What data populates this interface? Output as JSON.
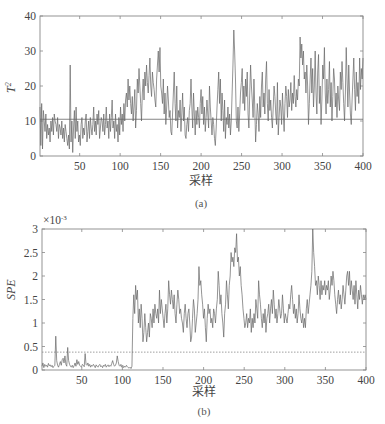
{
  "chart_data": [
    {
      "id": "a",
      "type": "line",
      "caption": "(a)",
      "xlabel": "采样",
      "ylabel": "T²",
      "ylabel_main": "T",
      "ylabel_sup": "2",
      "xlim": [
        1,
        400
      ],
      "ylim": [
        0,
        40
      ],
      "xticks": [
        50,
        100,
        150,
        200,
        250,
        300,
        350,
        400
      ],
      "yticks": [
        0,
        10,
        20,
        30,
        40
      ],
      "threshold": 10.5,
      "series": [
        {
          "name": "T2 statistic",
          "values": [
            14,
            3,
            15,
            2,
            13,
            10,
            7,
            12,
            5,
            9,
            6,
            8,
            4,
            10,
            7,
            11,
            6,
            12,
            10,
            9,
            7,
            11,
            5,
            9,
            8,
            6,
            10,
            5,
            8,
            4,
            9,
            7,
            5,
            3,
            6,
            2,
            26,
            4,
            10,
            1,
            8,
            13,
            5,
            14,
            7,
            10,
            4,
            6,
            3,
            9,
            11,
            5,
            8,
            6,
            10,
            12,
            4,
            7,
            10,
            5,
            11,
            8,
            6,
            9,
            14,
            7,
            10,
            6,
            12,
            9,
            13,
            5,
            8,
            11,
            10,
            7,
            12,
            6,
            9,
            14,
            8,
            10,
            5,
            12,
            7,
            11,
            16,
            8,
            10,
            5,
            12,
            7,
            9,
            4,
            11,
            6,
            14,
            9,
            12,
            7,
            15,
            10,
            16,
            18,
            14,
            22,
            16,
            20,
            15,
            12,
            17,
            10,
            14,
            19,
            8,
            13,
            22,
            18,
            25,
            20,
            15,
            10,
            18,
            22,
            16,
            24,
            20,
            26,
            21,
            18,
            23,
            28,
            20,
            17,
            24,
            21,
            19,
            16,
            14,
            22,
            26,
            30,
            24,
            31,
            20,
            18,
            15,
            22,
            12,
            18,
            9,
            14,
            20,
            16,
            11,
            13,
            7,
            6,
            12,
            18,
            24,
            15,
            10,
            20,
            8,
            13,
            11,
            16,
            7,
            12,
            18,
            10,
            14,
            6,
            5,
            9,
            11,
            7,
            13,
            15,
            22,
            14,
            8,
            18,
            12,
            6,
            13,
            9,
            14,
            11,
            8,
            15,
            19,
            12,
            17,
            9,
            14,
            7,
            11,
            16,
            12,
            8,
            20,
            14,
            10,
            6,
            11,
            9,
            5,
            3,
            8,
            14,
            19,
            24,
            15,
            22,
            10,
            18,
            13,
            7,
            16,
            5,
            11,
            9,
            14,
            8,
            12,
            6,
            10,
            18,
            26,
            36,
            30,
            22,
            10,
            8,
            14,
            7,
            12,
            18,
            21,
            25,
            15,
            20,
            13,
            22,
            17,
            24,
            12,
            8,
            18,
            26,
            20,
            16,
            11,
            22,
            14,
            4,
            9,
            15,
            12,
            7,
            17,
            11,
            20,
            24,
            14,
            18,
            12,
            22,
            27,
            15,
            10,
            19,
            13,
            16,
            11,
            8,
            14,
            20,
            17,
            12,
            9,
            21,
            6,
            11,
            16,
            14,
            9,
            18,
            12,
            7,
            15,
            20,
            17,
            11,
            19,
            14,
            16,
            21,
            13,
            18,
            15,
            23,
            17,
            14,
            19,
            16,
            22,
            20,
            34,
            28,
            32,
            26,
            30,
            22,
            24,
            18,
            26,
            20,
            9,
            15,
            22,
            28,
            18,
            25,
            14,
            20,
            30,
            18,
            12,
            24,
            29,
            15,
            20,
            9,
            16,
            26,
            22,
            31,
            18,
            12,
            22,
            15,
            19,
            27,
            14,
            21,
            10,
            17,
            25,
            22,
            14,
            18,
            11,
            20,
            16,
            13,
            24,
            19,
            27,
            21,
            15,
            10,
            18,
            31,
            22,
            14,
            26,
            18,
            12,
            9,
            16,
            22,
            28,
            19,
            13,
            24,
            17,
            21,
            15,
            28,
            19,
            25,
            22,
            28
          ]
        }
      ],
      "colors": {
        "line": "#666666",
        "threshold": "#666666",
        "axes": "#888888"
      }
    },
    {
      "id": "b",
      "type": "line",
      "caption": "(b)",
      "xlabel": "采样",
      "ylabel": "SPE",
      "scale_label": "×10⁻³",
      "scale_base": "×10",
      "scale_exp": "-3",
      "xlim": [
        1,
        400
      ],
      "ylim": [
        0,
        3
      ],
      "xticks": [
        50,
        100,
        150,
        200,
        250,
        300,
        350,
        400
      ],
      "yticks": [
        0,
        0.5,
        1,
        1.5,
        2,
        2.5,
        3
      ],
      "ytick_labels": [
        "0",
        "0.5",
        "1",
        "1.5",
        "2",
        "2.5",
        "3"
      ],
      "threshold": 0.38,
      "threshold_style": "dotted",
      "series": [
        {
          "name": "SPE statistic (×10⁻³)",
          "values": [
            0.08,
            0.15,
            0.05,
            0.12,
            0.08,
            0.1,
            0.06,
            0.14,
            0.09,
            0.11,
            0.07,
            0.1,
            0.05,
            0.08,
            0.1,
            0.72,
            0.2,
            0.1,
            0.06,
            0.12,
            0.18,
            0.1,
            0.22,
            0.25,
            0.15,
            0.3,
            0.12,
            0.08,
            0.48,
            0.2,
            0.12,
            0.08,
            0.06,
            0.1,
            0.05,
            0.09,
            0.15,
            0.08,
            0.22,
            0.12,
            0.18,
            0.1,
            0.08,
            0.06,
            0.12,
            0.1,
            0.07,
            0.35,
            0.12,
            0.1,
            0.15,
            0.08,
            0.12,
            0.06,
            0.1,
            0.08,
            0.12,
            0.09,
            0.05,
            0.11,
            0.08,
            0.06,
            0.1,
            0.12,
            0.07,
            0.09,
            0.05,
            0.1,
            0.08,
            0.12,
            0.06,
            0.09,
            0.11,
            0.07,
            0.1,
            0.08,
            0.14,
            0.2,
            0.12,
            0.08,
            0.1,
            0.15,
            0.3,
            0.18,
            0.1,
            0.08,
            0.12,
            0.06,
            0.1,
            0.05,
            0.08,
            0.06,
            0.1,
            0.07,
            0.05,
            0.04,
            0.06,
            0.03,
            0.08,
            1.1,
            1.6,
            1.2,
            1.8,
            1.5,
            1.7,
            1.0,
            1.3,
            0.9,
            1.4,
            1.1,
            0.6,
            0.8,
            1.2,
            0.9,
            0.6,
            0.8,
            1.0,
            0.7,
            1.2,
            1.1,
            0.9,
            1.3,
            1.0,
            1.4,
            1.2,
            1.1,
            1.3,
            1.0,
            1.7,
            1.2,
            1.5,
            1.3,
            1.1,
            0.9,
            1.2,
            1.4,
            1.0,
            1.3,
            1.9,
            1.6,
            1.4,
            1.7,
            1.5,
            1.3,
            1.6,
            1.2,
            1.0,
            1.4,
            1.7,
            1.5,
            1.2,
            1.3,
            1.1,
            1.0,
            0.8,
            1.2,
            1.4,
            1.1,
            0.9,
            1.2,
            1.3,
            1.0,
            0.6,
            0.7,
            1.1,
            1.5,
            1.3,
            0.8,
            1.0,
            1.2,
            1.5,
            2.2,
            1.8,
            1.9,
            1.6,
            1.4,
            1.1,
            1.3,
            0.9,
            0.6,
            1.1,
            1.4,
            1.2,
            1.3,
            1.0,
            1.1,
            0.9,
            1.3,
            1.2,
            1.0,
            1.3,
            1.5,
            2.1,
            1.8,
            1.4,
            1.6,
            1.2,
            1.0,
            0.7,
            1.2,
            1.4,
            1.9,
            1.6,
            1.3,
            1.8,
            2.0,
            2.5,
            2.3,
            2.4,
            2.2,
            2.6,
            2.5,
            2.9,
            2.3,
            2.4,
            2.0,
            2.2,
            1.8,
            1.6,
            1.3,
            1.1,
            0.9,
            1.0,
            1.2,
            0.9,
            1.1,
            1.0,
            1.3,
            0.8,
            1.1,
            0.9,
            1.2,
            1.0,
            1.5,
            1.3,
            1.1,
            1.9,
            1.6,
            1.4,
            1.1,
            0.9,
            1.2,
            1.0,
            1.3,
            0.8,
            1.1,
            1.2,
            1.4,
            1.0,
            1.3,
            1.5,
            1.2,
            1.7,
            1.4,
            1.1,
            1.3,
            1.0,
            1.2,
            1.5,
            1.3,
            1.1,
            1.2,
            1.6,
            1.3,
            1.0,
            1.2,
            1.1,
            1.0,
            1.2,
            1.4,
            1.3,
            1.6,
            1.8,
            1.5,
            1.2,
            1.4,
            1.1,
            1.3,
            1.0,
            1.2,
            1.6,
            1.3,
            1.1,
            1.0,
            1.2,
            0.9,
            1.1,
            0.9,
            1.3,
            1.5,
            1.2,
            1.4,
            1.6,
            1.8,
            2.1,
            3.0,
            2.5,
            2.2,
            1.8,
            1.9,
            1.6,
            2.0,
            1.8,
            1.5,
            1.9,
            1.6,
            1.8,
            1.7,
            1.9,
            1.6,
            1.8,
            1.7,
            1.9,
            1.5,
            1.7,
            2.0,
            1.8,
            2.1,
            1.9,
            1.6,
            1.4,
            1.2,
            1.5,
            1.7,
            1.4,
            1.6,
            1.3,
            1.5,
            1.8,
            1.6,
            1.4,
            1.7,
            2.0,
            2.1,
            1.8,
            2.1,
            1.6,
            1.9,
            1.7,
            1.5,
            1.8,
            1.4,
            1.9,
            1.6,
            1.3,
            1.7,
            1.5,
            1.8,
            1.6,
            1.4,
            1.6,
            1.5,
            1.6,
            1.5
          ]
        }
      ],
      "colors": {
        "line": "#666666",
        "threshold": "#888888",
        "axes": "#888888"
      }
    }
  ]
}
